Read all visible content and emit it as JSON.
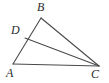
{
  "figure": {
    "kind": "geometry-diagram",
    "background_color": "#ffffff",
    "stroke_color": "#4a4a4a",
    "label_color": "#2b2b2b",
    "width": 109,
    "height": 83,
    "points": {
      "A": {
        "label": "A",
        "x": 13,
        "y": 64,
        "label_x": 6,
        "label_y": 67
      },
      "B": {
        "label": "B",
        "x": 41,
        "y": 18,
        "label_x": 37,
        "label_y": 1
      },
      "C": {
        "label": "C",
        "x": 99,
        "y": 66,
        "label_x": 91,
        "label_y": 68
      },
      "D": {
        "label": "D",
        "x": 25,
        "y": 38,
        "label_x": 11,
        "label_y": 24
      }
    },
    "segments": [
      {
        "name": "segment-AB",
        "from": "A",
        "to": "B"
      },
      {
        "name": "segment-BC",
        "from": "B",
        "to": "C"
      },
      {
        "name": "segment-AC",
        "from": "A",
        "to": "C"
      },
      {
        "name": "segment-DC",
        "from": "D",
        "to": "C"
      }
    ]
  }
}
